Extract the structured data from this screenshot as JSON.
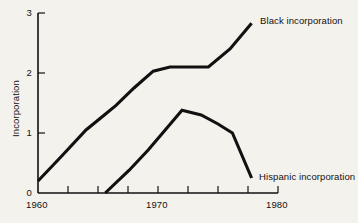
{
  "chart_data": {
    "type": "line",
    "title": "",
    "xlabel": "",
    "ylabel": "Incorporation",
    "xlim": [
      1960,
      1980
    ],
    "ylim": [
      0,
      3
    ],
    "grid": false,
    "legend_position": "inline-right-of-line-ends",
    "x_tick_labels": [
      "1960",
      "1970",
      "1980"
    ],
    "x_tick_values": [
      1960,
      1970,
      1980
    ],
    "x_minor_ticks": [
      1962.5,
      1965,
      1967.5,
      1972.5,
      1975,
      1977.5
    ],
    "y_tick_labels": [
      "0",
      "1",
      "2",
      "3"
    ],
    "y_tick_values": [
      0,
      1,
      2,
      3
    ],
    "series": [
      {
        "name": "Black incorporation",
        "label": "Black incorporation",
        "color": "#111111",
        "x": [
          1960.0,
          1962.0,
          1964.0,
          1965.4,
          1966.5,
          1968.0,
          1969.6,
          1971.0,
          1974.2,
          1976.0,
          1977.8
        ],
        "values": [
          0.2,
          0.62,
          1.05,
          1.28,
          1.46,
          1.75,
          2.03,
          2.1,
          2.1,
          2.4,
          2.83
        ]
      },
      {
        "name": "Hispanic incorporation",
        "label": "Hispanic incorporation",
        "color": "#111111",
        "x": [
          1965.6,
          1967.6,
          1969.2,
          1972.0,
          1973.6,
          1975.0,
          1976.2,
          1977.8
        ],
        "values": [
          0.0,
          0.38,
          0.72,
          1.38,
          1.3,
          1.15,
          1.0,
          0.25
        ]
      }
    ]
  },
  "axis": {
    "y_title": "Incorporation"
  },
  "labels": {
    "black_series": "Black incorporation",
    "hispanic_series": "Hispanic incorporation"
  },
  "colors": {
    "background": "#f4f2ed",
    "ink": "#111111"
  }
}
